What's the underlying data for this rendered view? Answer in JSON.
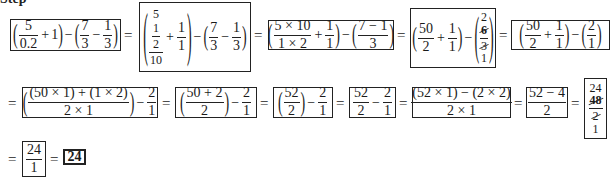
{
  "header": {
    "label_partial": "Step"
  },
  "row1": {
    "box1": {
      "a_num": "5",
      "a_den": "0.2",
      "plus": "+",
      "one": "1",
      "minus": "−",
      "b_num": "7",
      "b_den": "3",
      "c_num": "1",
      "c_den": "3"
    },
    "box2": {
      "top_num": "5",
      "inner_num": "1",
      "inner_den": "2",
      "bottom": "10",
      "plus": "+",
      "p_num": "1",
      "p_den": "1",
      "minus": "−",
      "b_num": "7",
      "b_den": "3",
      "c_num": "1",
      "c_den": "3"
    },
    "box3": {
      "a_num": "5 × 10",
      "a_den": "1 × 2",
      "plus": "+",
      "p_num": "1",
      "p_den": "1",
      "minus": "−",
      "b_num": "7 − 1",
      "b_den": "3"
    },
    "box4": {
      "a_num": "50",
      "a_den": "2",
      "plus": "+",
      "p_num": "1",
      "p_den": "1",
      "minus": "−",
      "c_top": "2",
      "c_num": "6",
      "c_den": "3",
      "c_bottom": "1"
    },
    "box5": {
      "a_num": "50",
      "a_den": "2",
      "plus": "+",
      "p_num": "1",
      "p_den": "1",
      "minus": "−",
      "c_num": "2",
      "c_den": "1"
    }
  },
  "row2": {
    "box1": {
      "a_num": "(50 × 1) + (1 × 2)",
      "a_den": "2 × 1",
      "minus": "−",
      "b_num": "2",
      "b_den": "1"
    },
    "box2": {
      "a_num": "50 + 2",
      "a_den": "2",
      "minus": "−",
      "b_num": "2",
      "b_den": "1"
    },
    "box3": {
      "a_num": "52",
      "a_den": "2",
      "minus": "−",
      "b_num": "2",
      "b_den": "1"
    },
    "box4": {
      "a_num": "52",
      "a_den": "2",
      "minus": "−",
      "b_num": "2",
      "b_den": "1"
    },
    "box5": {
      "a_num": "(52 × 1) − (2 × 2)",
      "a_den": "2 × 1"
    },
    "box6": {
      "a_num": "52 − 4",
      "a_den": "2"
    },
    "box7": {
      "top": "24",
      "num": "48",
      "den": "2",
      "bottom": "1"
    }
  },
  "row3": {
    "box1": {
      "num": "24",
      "den": "1"
    },
    "final": {
      "value": "24"
    }
  },
  "symbols": {
    "equals": "=",
    "lparen": "(",
    "rparen": ")"
  }
}
